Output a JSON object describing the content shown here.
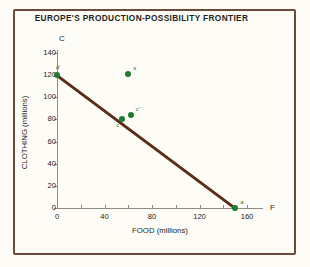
{
  "chart_data": {
    "type": "line",
    "title": "EUROPE'S PRODUCTION-POSSIBILITY FRONTIER",
    "xlabel": "FOOD (millions)",
    "ylabel": "CLOTHING (millions)",
    "x_axis_cap": "F",
    "y_axis_cap": "C",
    "xlim": [
      0,
      173
    ],
    "ylim": [
      0,
      140
    ],
    "xticks": [
      0,
      40,
      80,
      120,
      160
    ],
    "xticklabels": [
      "0",
      "40",
      "80",
      "120",
      "160"
    ],
    "yticks": [
      0,
      20,
      40,
      60,
      80,
      100,
      120,
      140
    ],
    "yticklabels": [
      "0",
      "20",
      "40",
      "60",
      "80",
      "100",
      "120",
      "140"
    ],
    "grid": false,
    "legend": "none",
    "series": [
      {
        "name": "production-possibility frontier",
        "type": "line",
        "color": "#5a2d18",
        "x": [
          0,
          150
        ],
        "y": [
          120,
          0
        ]
      }
    ],
    "points": [
      {
        "label": "d",
        "x": 0,
        "y": 120,
        "color": "#1f7a32"
      },
      {
        "label": "s",
        "x": 60,
        "y": 121,
        "color": "#1f7a32"
      },
      {
        "label": "c",
        "x": 55,
        "y": 80,
        "color": "#1f7a32"
      },
      {
        "label": "c'",
        "x": 62,
        "y": 84,
        "color": "#1f7a32"
      },
      {
        "label": "a",
        "x": 150,
        "y": 0,
        "color": "#1f7a32"
      }
    ]
  },
  "style": {
    "background": "#fdfcf7",
    "frame_color": "#6b4a3a",
    "axis_color": "#8f8b84",
    "text_color": "#231f20",
    "line_color": "#5a2d18",
    "point_color": "#1f7a32"
  }
}
